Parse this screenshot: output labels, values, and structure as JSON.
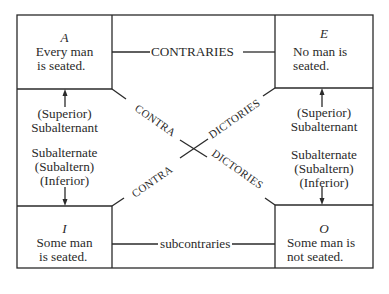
{
  "corners": {
    "A": {
      "letter": "A",
      "line1": "Every man",
      "line2": "is seated."
    },
    "E": {
      "letter": "E",
      "line1": "No  man is",
      "line2": "seated."
    },
    "I": {
      "letter": "I",
      "line1": "Some man",
      "line2": "is seated."
    },
    "O": {
      "letter": "O",
      "line1": "Some man is",
      "line2": "not seated."
    }
  },
  "relations": {
    "top": "CONTRARIES",
    "bottom": "subcontraries",
    "diag_left_upper": "CONTRA",
    "diag_right_upper": "DICTORIES",
    "diag_left_lower": "CONTRA",
    "diag_right_lower": "DICTORIES"
  },
  "sides": {
    "left": {
      "superior_1": "(Superior)",
      "superior_2": "Subalternant",
      "inferior_1": "Subalternate",
      "inferior_2": "(Subaltern)",
      "inferior_3": "(Inferior)"
    },
    "right": {
      "superior_1": "(Superior)",
      "superior_2": "Subalternant",
      "inferior_1": "Subalternate",
      "inferior_2": "(Subaltern)",
      "inferior_3": "(Inferior)"
    }
  },
  "colors": {
    "ink": "#2a2a2a",
    "paper": "#ffffff"
  }
}
